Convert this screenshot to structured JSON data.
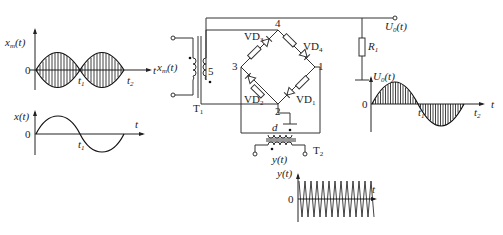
{
  "diagram": {
    "plots": {
      "xm": {
        "ylabel": "x_m(t)",
        "xlabel": "t",
        "origin": "0",
        "ticks": [
          "t1",
          "t2"
        ]
      },
      "x": {
        "ylabel": "x(t)",
        "xlabel": "t",
        "origin": "0",
        "ticks": [
          "t1"
        ]
      },
      "u0": {
        "ylabel": "U0(t)",
        "xlabel": "t",
        "origin": "0",
        "ticks": [
          "t1",
          "t2"
        ]
      },
      "y": {
        "ylabel": "y(t)",
        "xlabel": "t",
        "origin": "0"
      }
    },
    "circuit": {
      "input_label": "x_m(t)",
      "transformer1": "T1",
      "transformer2": "T2",
      "tap_label": "5",
      "node_labels": [
        "1",
        "2",
        "3",
        "4"
      ],
      "diodes": [
        "VD1",
        "VD2",
        "VD3",
        "VD4"
      ],
      "resistor": "R1",
      "output_label": "U0(t)",
      "ref_input_label": "y(t)",
      "tap2_label": "d"
    }
  }
}
